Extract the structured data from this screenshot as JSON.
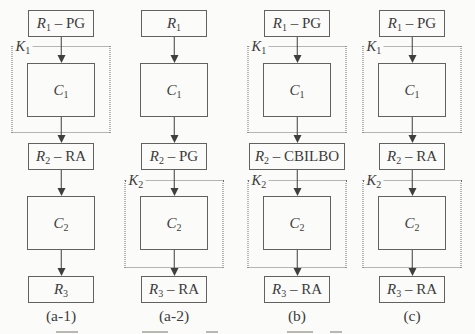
{
  "figure": {
    "colors": {
      "bg": "#fbfbf9",
      "box_border": "#616161",
      "dotted_border": "#6e6e6e",
      "ink": "#3c3c3c",
      "arrow": "#3f3f3f"
    },
    "columns": [
      {
        "caption": "(a-1)",
        "r1": {
          "var": "R",
          "sub": "1",
          "rest": " – PG"
        },
        "k1": {
          "var": "K",
          "sub": "1"
        },
        "c1": {
          "var": "C",
          "sub": "1",
          "rest": ""
        },
        "r2": {
          "var": "R",
          "sub": "2",
          "rest": " – RA"
        },
        "c2": {
          "var": "C",
          "sub": "2",
          "rest": ""
        },
        "r3": {
          "var": "R",
          "sub": "3",
          "rest": ""
        }
      },
      {
        "caption": "(a-2)",
        "r1": {
          "var": "R",
          "sub": "1",
          "rest": ""
        },
        "c1": {
          "var": "C",
          "sub": "1",
          "rest": ""
        },
        "r2": {
          "var": "R",
          "sub": "2",
          "rest": " – PG"
        },
        "k2": {
          "var": "K",
          "sub": "2"
        },
        "c2": {
          "var": "C",
          "sub": "2",
          "rest": ""
        },
        "r3": {
          "var": "R",
          "sub": "3",
          "rest": " – RA"
        }
      },
      {
        "caption": "(b)",
        "r1": {
          "var": "R",
          "sub": "1",
          "rest": " – PG"
        },
        "k1": {
          "var": "K",
          "sub": "1"
        },
        "c1": {
          "var": "C",
          "sub": "1",
          "rest": ""
        },
        "r2": {
          "var": "R",
          "sub": "2",
          "rest": " – CBILBO"
        },
        "k2": {
          "var": "K",
          "sub": "2"
        },
        "c2": {
          "var": "C",
          "sub": "2",
          "rest": ""
        },
        "r3": {
          "var": "R",
          "sub": "3",
          "rest": " – RA"
        }
      },
      {
        "caption": "(c)",
        "r1": {
          "var": "R",
          "sub": "1",
          "rest": " – PG"
        },
        "k1": {
          "var": "K",
          "sub": "1"
        },
        "c1": {
          "var": "C",
          "sub": "1",
          "rest": ""
        },
        "r2": {
          "var": "R",
          "sub": "2",
          "rest": " – RA"
        },
        "k2": {
          "var": "K",
          "sub": "2"
        },
        "c2": {
          "var": "C",
          "sub": "2",
          "rest": ""
        },
        "r3": {
          "var": "R",
          "sub": "3",
          "rest": " – RA"
        }
      }
    ]
  }
}
